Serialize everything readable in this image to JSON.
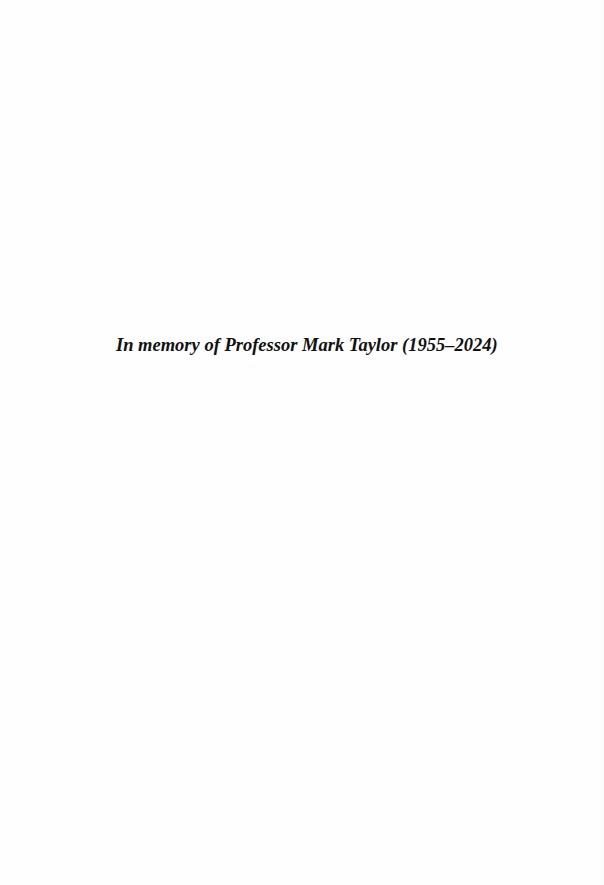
{
  "page": {
    "dedication": "In memory of Professor Mark Taylor (1955–2024)",
    "background_color": "#fefefe",
    "text_color": "#111111"
  }
}
